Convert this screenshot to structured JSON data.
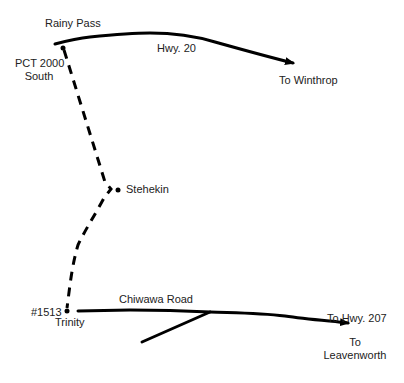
{
  "map": {
    "title": "Trail route map: Rainy Pass to Trinity",
    "colors": {
      "line": "#000000",
      "text": "#222222",
      "background": "#ffffff"
    },
    "labels": {
      "rainy_pass": "Rainy Pass",
      "hwy20": "Hwy. 20",
      "to_winthrop": "To Winthrop",
      "pct_line1": "PCT 2000",
      "pct_line2": "South",
      "stehekin": "Stehekin",
      "trailhead_number": "#1513",
      "trinity": "Trinity",
      "chiwawa_road": "Chiwawa Road",
      "to_hwy207": "To Hwy. 207",
      "to_leavenworth_line1": "To",
      "to_leavenworth_line2": "Leavenworth"
    },
    "points": [
      {
        "name": "Rainy Pass trailhead",
        "x": 63,
        "y": 48
      },
      {
        "name": "Stehekin",
        "x": 118,
        "y": 190
      },
      {
        "name": "Trinity",
        "x": 67,
        "y": 311
      }
    ],
    "roads": [
      {
        "name": "Hwy. 20",
        "direction": "To Winthrop"
      },
      {
        "name": "Chiwawa Road",
        "direction": "To Hwy. 207 / To Leavenworth"
      }
    ],
    "trail": {
      "name": "PCT 2000 South",
      "style": "dashed"
    }
  }
}
